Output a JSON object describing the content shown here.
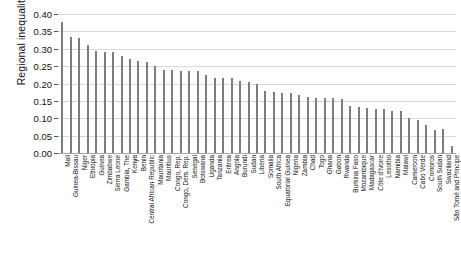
{
  "chart_data": {
    "type": "bar",
    "title": "",
    "xlabel": "",
    "ylabel": "Regional inequality",
    "ylim": [
      0.0,
      0.4
    ],
    "ytick_labels": [
      "0.00",
      "0.05",
      "0.10",
      "0.15",
      "0.20",
      "0.25",
      "0.30",
      "0.35",
      "0.40"
    ],
    "ytick_values": [
      0.0,
      0.05,
      0.1,
      0.15,
      0.2,
      0.25,
      0.3,
      0.35,
      0.4
    ],
    "grid": true,
    "legend": "none",
    "bar_color": "#7d7d7d",
    "grid_color": "#d8d8d8",
    "categories": [
      "Mali",
      "Guinea-Bissau",
      "Niger",
      "Ethiopia",
      "Guinea",
      "Zimbabwe",
      "Sierra Leone",
      "Gambia, The",
      "Kenya",
      "Benin",
      "Central African Republic",
      "Mauritania",
      "Mauritius",
      "Congo, Rep.",
      "Congo, Dem. Rep.",
      "Senegal",
      "Botswana",
      "Uganda",
      "Tanzania",
      "Eritrea",
      "Angola",
      "Burundi",
      "Sudan",
      "Liberia",
      "Somalia",
      "South Africa",
      "Equatorial Guinea",
      "Nigeria",
      "Zambia",
      "Chad",
      "Togo",
      "Ghana",
      "Gabon",
      "Rwanda",
      "Burkina Faso",
      "Mozambique",
      "Madagascar",
      "Côte d'Ivoire",
      "Lesotho",
      "Namibia",
      "Malawi",
      "Cameroon",
      "Cabo Verde",
      "Comoros",
      "South Sudan",
      "Swaziland",
      "São Tomé and Principe"
    ],
    "values": [
      0.378,
      0.334,
      0.332,
      0.312,
      0.295,
      0.292,
      0.292,
      0.279,
      0.27,
      0.266,
      0.261,
      0.25,
      0.24,
      0.238,
      0.236,
      0.236,
      0.236,
      0.224,
      0.217,
      0.217,
      0.216,
      0.208,
      0.204,
      0.198,
      0.178,
      0.175,
      0.174,
      0.172,
      0.168,
      0.16,
      0.159,
      0.159,
      0.158,
      0.156,
      0.134,
      0.133,
      0.13,
      0.128,
      0.126,
      0.122,
      0.12,
      0.101,
      0.094,
      0.08,
      0.065,
      0.07,
      0.02
    ]
  }
}
